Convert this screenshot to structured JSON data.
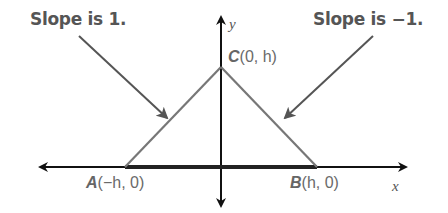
{
  "diagram": {
    "type": "coordinate-plane-triangle",
    "axes": {
      "x_label": "x",
      "y_label": "y"
    },
    "callouts": [
      {
        "id": "left",
        "text": "Slope is 1.",
        "points_to": "side AC"
      },
      {
        "id": "right",
        "text": "Slope is −1.",
        "points_to": "side BC"
      }
    ],
    "vertices": {
      "A": {
        "name": "A",
        "coords": "(−h, 0)"
      },
      "B": {
        "name": "B",
        "coords": "(h, 0)"
      },
      "C": {
        "name": "C",
        "coords": "(0, h)"
      }
    },
    "colors": {
      "axis": "#111111",
      "base": "#222222",
      "sides": "#777777",
      "pointer": "#555555",
      "label": "#666666"
    }
  }
}
